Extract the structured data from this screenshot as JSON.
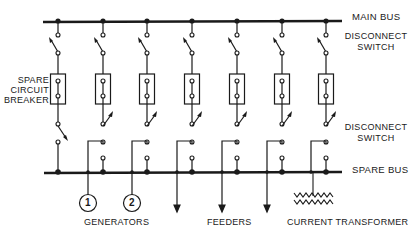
{
  "diagram": {
    "type": "single-line electrical bus diagram",
    "labels": {
      "main_bus": "MAIN BUS",
      "disconnect_switch_top_1": "DISCONNECT",
      "disconnect_switch_top_2": "SWITCH",
      "spare_breaker_1": "SPARE",
      "spare_breaker_2": "CIRCUIT",
      "spare_breaker_3": "BREAKER",
      "disconnect_switch_bottom_1": "DISCONNECT",
      "disconnect_switch_bottom_2": "SWITCH",
      "spare_bus": "SPARE BUS",
      "generators": "GENERATORS",
      "feeders": "FEEDERS",
      "current_transformer": "CURRENT TRANSFORMER"
    },
    "generators": [
      {
        "id": "1"
      },
      {
        "id": "2"
      }
    ],
    "circuit_count": 7,
    "colors": {
      "line": "#1a1a1a",
      "background": "#ffffff"
    }
  }
}
